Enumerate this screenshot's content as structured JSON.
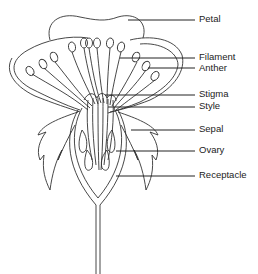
{
  "diagram": {
    "labels": [
      {
        "id": "petal",
        "text": "Petal",
        "y": 20
      },
      {
        "id": "filament",
        "text": "Filament",
        "y": 58
      },
      {
        "id": "anther",
        "text": "Anther",
        "y": 68
      },
      {
        "id": "stigma",
        "text": "Stigma",
        "y": 95
      },
      {
        "id": "style",
        "text": "Style",
        "y": 107
      },
      {
        "id": "sepal",
        "text": "Sepal",
        "y": 130
      },
      {
        "id": "ovary",
        "text": "Ovary",
        "y": 151
      },
      {
        "id": "receptacle",
        "text": "Receptacle",
        "y": 176
      }
    ]
  }
}
